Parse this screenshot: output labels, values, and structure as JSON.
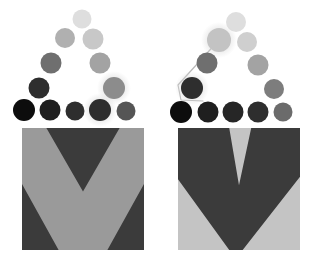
{
  "figure": {
    "width": 314,
    "height": 255,
    "background_color": "#ffffff",
    "panel_count": 2
  },
  "palette": {
    "background": "#ffffff",
    "chevron_dark": "#3b3b3b",
    "chevron_light": "#9a9a9a",
    "node_black": "#0d0d0d",
    "node_darkest": "#1f1f1f",
    "node_dark": "#2e2e2e",
    "node_mid_dark": "#555555",
    "node_mid": "#6f6f6f",
    "node_mid_light": "#8c8c8c",
    "node_light": "#b0b0b0",
    "node_lighter": "#c8c8c8",
    "node_lightest": "#dedede",
    "glow": "#d9d9d9",
    "connector_line": "#b8b8b8"
  },
  "panels": [
    {
      "id": "panel-left",
      "name": "left-panel",
      "label": "Left panel",
      "has_connector": false,
      "connector_points": [],
      "square": {
        "name": "left-chevron-square",
        "x": 22,
        "y": 128,
        "size": 122,
        "base_color": "#9a9a9a",
        "pattern": "down-chevron-thin",
        "pattern_color": "#3b3b3b",
        "description": "Mid-gray square with a dark downward chevron band across it"
      },
      "nodes": [
        {
          "id": "L-r0-c0",
          "label": "apex",
          "cx": 82,
          "cy": 19,
          "r": 9.5,
          "color": "#dedede",
          "highlighted": false
        },
        {
          "id": "L-r1-c0",
          "label": "row1-left",
          "cx": 65,
          "cy": 38,
          "r": 10,
          "color": "#b0b0b0",
          "highlighted": false
        },
        {
          "id": "L-r1-c1",
          "label": "row1-right",
          "cx": 93,
          "cy": 39,
          "r": 10.5,
          "color": "#c8c8c8",
          "highlighted": false
        },
        {
          "id": "L-r2-c0",
          "label": "row2-left",
          "cx": 51,
          "cy": 63,
          "r": 10.5,
          "color": "#6f6f6f",
          "highlighted": false
        },
        {
          "id": "L-r2-c2",
          "label": "row2-right",
          "cx": 100,
          "cy": 63,
          "r": 10.5,
          "color": "#a3a3a3",
          "highlighted": false
        },
        {
          "id": "L-r3-c0",
          "label": "row3-left",
          "cx": 39,
          "cy": 88,
          "r": 10.5,
          "color": "#2e2e2e",
          "highlighted": false
        },
        {
          "id": "L-r3-c3",
          "label": "row3-right",
          "cx": 114,
          "cy": 88,
          "r": 11,
          "color": "#8c8c8c",
          "highlighted": true
        },
        {
          "id": "L-r4-c0",
          "label": "base-1",
          "cx": 24,
          "cy": 110,
          "r": 11,
          "color": "#0d0d0d",
          "highlighted": false
        },
        {
          "id": "L-r4-c1",
          "label": "base-2",
          "cx": 50,
          "cy": 110,
          "r": 10.5,
          "color": "#1f1f1f",
          "highlighted": false
        },
        {
          "id": "L-r4-c2",
          "label": "base-3",
          "cx": 75,
          "cy": 111,
          "r": 9.5,
          "color": "#2e2e2e",
          "highlighted": false
        },
        {
          "id": "L-r4-c3",
          "label": "base-4",
          "cx": 100,
          "cy": 110,
          "r": 11,
          "color": "#2e2e2e",
          "highlighted": true
        },
        {
          "id": "L-r4-c4",
          "label": "base-5",
          "cx": 126,
          "cy": 111,
          "r": 9.5,
          "color": "#555555",
          "highlighted": false
        }
      ]
    },
    {
      "id": "panel-right",
      "name": "right-panel",
      "label": "Right panel",
      "has_connector": true,
      "connector_points": "62,40 21,85 24,100 46,101",
      "connector_color": "#b8b8b8",
      "connector_width": 1.2,
      "square": {
        "name": "right-chevron-square",
        "x": 21,
        "y": 128,
        "size": 122,
        "base_color": "#c4c4c4",
        "pattern": "down-chevron-thick",
        "pattern_color": "#3b3b3b",
        "description": "Light-gray square with a thick dark downward chevron filling most of it"
      },
      "nodes": [
        {
          "id": "R-r0-c0",
          "label": "apex",
          "cx": 79,
          "cy": 22,
          "r": 10,
          "color": "#dedede",
          "highlighted": false
        },
        {
          "id": "R-r1-c0",
          "label": "row1-left",
          "cx": 62,
          "cy": 40,
          "r": 12,
          "color": "#c3c3c3",
          "highlighted": true
        },
        {
          "id": "R-r1-c1",
          "label": "row1-right",
          "cx": 90,
          "cy": 42,
          "r": 10,
          "color": "#cfcfcf",
          "highlighted": false
        },
        {
          "id": "R-r2-c0",
          "label": "row2-left",
          "cx": 50,
          "cy": 63,
          "r": 10.5,
          "color": "#6f6f6f",
          "highlighted": false
        },
        {
          "id": "R-r2-c2",
          "label": "row2-right",
          "cx": 101,
          "cy": 65,
          "r": 10.5,
          "color": "#a3a3a3",
          "highlighted": false
        },
        {
          "id": "R-r3-c0",
          "label": "row3-left",
          "cx": 35,
          "cy": 88,
          "r": 11,
          "color": "#2e2e2e",
          "highlighted": true
        },
        {
          "id": "R-r3-c3",
          "label": "row3-right",
          "cx": 117,
          "cy": 89,
          "r": 10,
          "color": "#7d7d7d",
          "highlighted": false
        },
        {
          "id": "R-r4-c0",
          "label": "base-1",
          "cx": 24,
          "cy": 112,
          "r": 11,
          "color": "#0d0d0d",
          "highlighted": false
        },
        {
          "id": "R-r4-c1",
          "label": "base-2",
          "cx": 51,
          "cy": 112,
          "r": 10.5,
          "color": "#1f1f1f",
          "highlighted": false
        },
        {
          "id": "R-r4-c2",
          "label": "base-3",
          "cx": 76,
          "cy": 112,
          "r": 10.5,
          "color": "#262626",
          "highlighted": false
        },
        {
          "id": "R-r4-c3",
          "label": "base-4",
          "cx": 101,
          "cy": 112,
          "r": 10.5,
          "color": "#2e2e2e",
          "highlighted": false
        },
        {
          "id": "R-r4-c4",
          "label": "base-5",
          "cx": 126,
          "cy": 112,
          "r": 9.5,
          "color": "#6b6b6b",
          "highlighted": false
        }
      ]
    }
  ]
}
